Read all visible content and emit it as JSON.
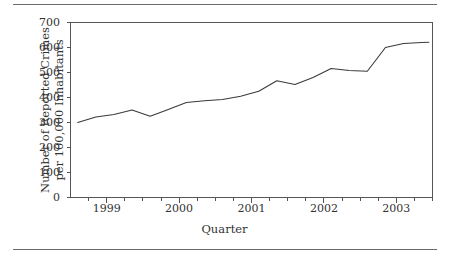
{
  "figure": {
    "rule_color": "#6b6b6b",
    "line_color": "#3a3a3a",
    "axis_color": "#555555",
    "background": "#ffffff"
  },
  "axes": {
    "x_title": "Quarter",
    "y_title_line1": "Number of Reported Crimes",
    "y_title_line2": "per 100,000 Inhabitants",
    "y_ticks": [
      "0",
      "100",
      "200",
      "300",
      "400",
      "500",
      "600",
      "700"
    ],
    "x_ticks": [
      "1999",
      "2000",
      "2001",
      "2002",
      "2003"
    ]
  },
  "chart_data": {
    "type": "line",
    "title": "",
    "xlabel": "Quarter",
    "ylabel": "Number of Reported Crimes per 100,000 Inhabitants",
    "xlim": [
      1998.5,
      2003.5
    ],
    "ylim": [
      0,
      700
    ],
    "grid": false,
    "legend": "none",
    "x": [
      "1998 Q4",
      "1999 Q1",
      "1999 Q2",
      "1999 Q3",
      "1999 Q4",
      "2000 Q1",
      "2000 Q2",
      "2000 Q3",
      "2000 Q4",
      "2001 Q1",
      "2001 Q2",
      "2001 Q3",
      "2001 Q4",
      "2002 Q1",
      "2002 Q2",
      "2002 Q3",
      "2002 Q4",
      "2003 Q1",
      "2003 Q2",
      "2003 Q3",
      "2003 Q4"
    ],
    "x_numeric": [
      1998.6,
      1998.85,
      1999.1,
      1999.35,
      1999.6,
      1999.85,
      2000.1,
      2000.35,
      2000.6,
      2000.85,
      2001.1,
      2001.35,
      2001.6,
      2001.85,
      2002.1,
      2002.35,
      2002.6,
      2002.85,
      2003.1,
      2003.35,
      2003.45
    ],
    "values": [
      300,
      322,
      332,
      350,
      325,
      352,
      380,
      387,
      392,
      405,
      425,
      467,
      452,
      480,
      516,
      508,
      505,
      600,
      616,
      620,
      621
    ],
    "y_ticks": [
      0,
      100,
      200,
      300,
      400,
      500,
      600,
      700
    ],
    "x_tick_values": [
      1999,
      2000,
      2001,
      2002,
      2003
    ]
  }
}
